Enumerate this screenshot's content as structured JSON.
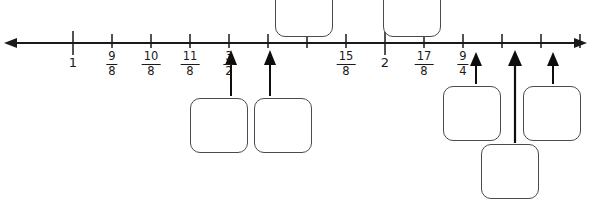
{
  "diagram": {
    "type": "number-line-with-answer-boxes",
    "axis": {
      "left_arrowhead_x": 8,
      "right_arrowhead_x": 583,
      "line_y": 43,
      "tick_spacing_px": 38.9,
      "unit_fraction": "1/8",
      "start_value": 1,
      "end_value": 2.5
    },
    "ticks": [
      {
        "index": 0,
        "x": 73,
        "value": "1",
        "label": "1",
        "kind": "integer",
        "major": true,
        "labeled": true,
        "arrow": false
      },
      {
        "index": 1,
        "x": 112,
        "value": "9/8",
        "label": "9/8",
        "kind": "fraction",
        "major": false,
        "labeled": true,
        "arrow": false
      },
      {
        "index": 2,
        "x": 151,
        "value": "10/8",
        "label": "10/8",
        "kind": "fraction",
        "major": false,
        "labeled": true,
        "arrow": false
      },
      {
        "index": 3,
        "x": 190,
        "value": "11/8",
        "label": "11/8",
        "kind": "fraction",
        "major": false,
        "labeled": true,
        "arrow": false
      },
      {
        "index": 4,
        "x": 229,
        "value": "3/2",
        "label": "3/2",
        "kind": "fraction",
        "major": false,
        "labeled": true,
        "arrow": false
      },
      {
        "index": 5,
        "x": 268,
        "value": "13/8",
        "label": "",
        "kind": "blank",
        "major": false,
        "labeled": false,
        "arrow": true
      },
      {
        "index": 6,
        "x": 307,
        "value": "14/8",
        "label": "",
        "kind": "blank",
        "major": false,
        "labeled": false,
        "arrow": true
      },
      {
        "index": 7,
        "x": 346,
        "value": "15/8",
        "label": "15/8",
        "kind": "fraction",
        "major": false,
        "labeled": true,
        "arrow": false
      },
      {
        "index": 8,
        "x": 385,
        "value": "2",
        "label": "2",
        "kind": "integer",
        "major": true,
        "labeled": true,
        "arrow": false
      },
      {
        "index": 9,
        "x": 424,
        "value": "17/8",
        "label": "17/8",
        "kind": "fraction",
        "major": false,
        "labeled": true,
        "arrow": false
      },
      {
        "index": 10,
        "x": 463,
        "value": "9/4",
        "label": "9/4",
        "kind": "fraction",
        "major": false,
        "labeled": true,
        "arrow": false
      },
      {
        "index": 11,
        "x": 502,
        "value": "19/8",
        "label": "",
        "kind": "blank",
        "major": false,
        "labeled": false,
        "arrow": true
      },
      {
        "index": 12,
        "x": 541,
        "value": "20/8",
        "label": "",
        "kind": "blank",
        "major": false,
        "labeled": false,
        "arrow": true
      },
      {
        "index": 13,
        "x": 580,
        "value": "21/8",
        "label": "",
        "kind": "blank",
        "major": false,
        "labeled": false,
        "arrow": true
      }
    ],
    "labels": [
      {
        "name": "tick-label-1",
        "text": "1",
        "x": 73,
        "kind": "integer"
      },
      {
        "name": "tick-label-9-8",
        "numerator": "9",
        "denominator": "8",
        "x": 112,
        "kind": "fraction"
      },
      {
        "name": "tick-label-10-8",
        "numerator": "10",
        "denominator": "8",
        "x": 151,
        "kind": "fraction"
      },
      {
        "name": "tick-label-11-8",
        "numerator": "11",
        "denominator": "8",
        "x": 190,
        "kind": "fraction"
      },
      {
        "name": "tick-label-3-2",
        "numerator": "3",
        "denominator": "2",
        "x": 229,
        "kind": "fraction"
      },
      {
        "name": "tick-label-15-8",
        "numerator": "15",
        "denominator": "8",
        "x": 346,
        "kind": "fraction"
      },
      {
        "name": "tick-label-2",
        "text": "2",
        "x": 385,
        "kind": "integer"
      },
      {
        "name": "tick-label-17-8",
        "numerator": "17",
        "denominator": "8",
        "x": 424,
        "kind": "fraction"
      },
      {
        "name": "tick-label-9-4",
        "numerator": "9",
        "denominator": "4",
        "x": 463,
        "kind": "fraction"
      }
    ],
    "arrows": [
      {
        "name": "arrow-marker-1",
        "x": 231,
        "tip_y": 50,
        "tail_y": 96,
        "length": 46,
        "points_to_tick_index": 5
      },
      {
        "name": "arrow-marker-2",
        "x": 270,
        "tip_y": 50,
        "tail_y": 96,
        "length": 46,
        "points_to_tick_index": 6
      },
      {
        "name": "arrow-marker-3",
        "x": 476,
        "tip_y": 52,
        "tail_y": 84,
        "length": 32,
        "points_to_tick_index": 11
      },
      {
        "name": "arrow-marker-4",
        "x": 515,
        "tip_y": 50,
        "tail_y": 143,
        "length": 93,
        "points_to_tick_index": 12
      },
      {
        "name": "arrow-marker-5",
        "x": 553,
        "tip_y": 52,
        "tail_y": 84,
        "length": 32,
        "points_to_tick_index": 13
      }
    ],
    "answer_boxes": [
      {
        "name": "answer-box-top-1",
        "value": "",
        "x": 275,
        "y": -18,
        "width": 58,
        "height": 55,
        "clipped": "top"
      },
      {
        "name": "answer-box-top-2",
        "value": "",
        "x": 383,
        "y": -18,
        "width": 58,
        "height": 55,
        "clipped": "top"
      },
      {
        "name": "answer-box-lower-1",
        "value": "",
        "x": 190,
        "y": 98,
        "width": 58,
        "height": 55,
        "clipped": "none"
      },
      {
        "name": "answer-box-lower-2",
        "value": "",
        "x": 254,
        "y": 98,
        "width": 58,
        "height": 55,
        "clipped": "none"
      },
      {
        "name": "answer-box-right-1",
        "value": "",
        "x": 443,
        "y": 86,
        "width": 58,
        "height": 55,
        "clipped": "none"
      },
      {
        "name": "answer-box-right-2",
        "value": "",
        "x": 523,
        "y": 86,
        "width": 58,
        "height": 55,
        "clipped": "none"
      },
      {
        "name": "answer-box-bottom-mid",
        "value": "",
        "x": 481,
        "y": 144,
        "width": 58,
        "height": 55,
        "clipped": "bottom"
      }
    ],
    "colors": {
      "line": "#1a1a1a",
      "tick": "#1a1a1a",
      "label": "#1a1a1a",
      "arrow": "#0d0d0d",
      "box_border": "#4a4a52",
      "box_fill": "#ffffff",
      "background": "#ffffff"
    }
  }
}
